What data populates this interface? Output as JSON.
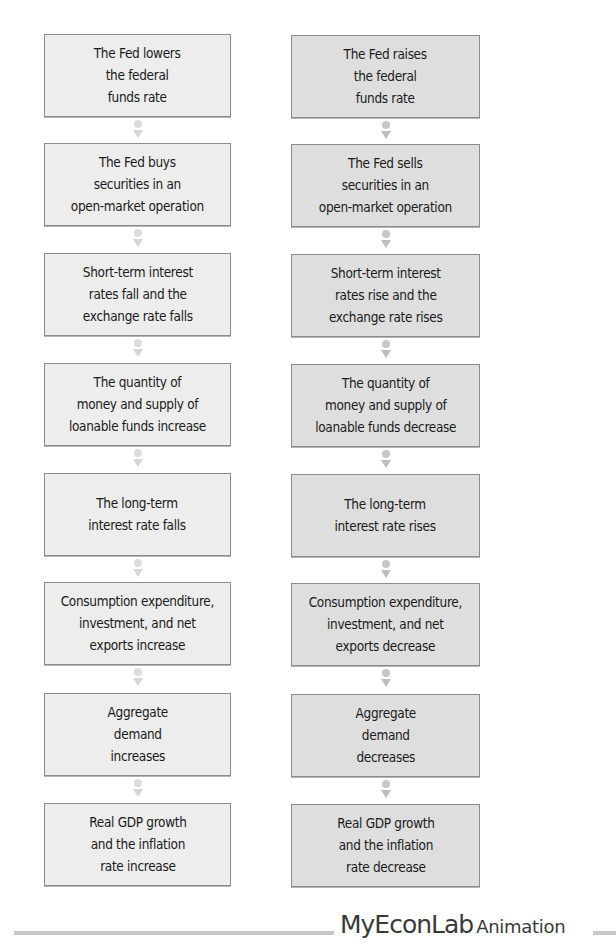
{
  "diagram": {
    "type": "flowchart",
    "columns": [
      {
        "id": "easing",
        "steps": [
          "The Fed lowers\nthe federal\nfunds rate",
          "The Fed buys\nsecurities in an\nopen-market operation",
          "Short-term interest\nrates fall and the\nexchange rate falls",
          "The quantity of\nmoney and supply of\nloanable funds increase",
          "The long-term\ninterest rate falls",
          "Consumption expenditure,\ninvestment, and net\nexports increase",
          "Aggregate\ndemand\nincreases",
          "Real GDP growth\nand the inflation\nrate increase"
        ]
      },
      {
        "id": "tightening",
        "steps": [
          "The Fed raises\nthe federal\nfunds rate",
          "The Fed sells\nsecurities in an\nopen-market operation",
          "Short-term interest\nrates rise and the\nexchange rate rises",
          "The quantity of\nmoney and supply of\nloanable funds decrease",
          "The long-term\ninterest rate rises",
          "Consumption expenditure,\ninvestment, and net\nexports decrease",
          "Aggregate\ndemand\ndecreases",
          "Real GDP growth\nand the inflation\nrate decrease"
        ]
      }
    ],
    "connector_icon": "dot-and-down-arrow-icon"
  },
  "colors": {
    "left_box_fill": "#ededed",
    "right_box_fill": "#dedede",
    "box_border": "#8c8c8c",
    "footer_rule": "#c8c8c8",
    "footer_text": "#3a3a3a"
  },
  "footer": {
    "brand": "MyEconLab",
    "suffix": "Animation"
  }
}
